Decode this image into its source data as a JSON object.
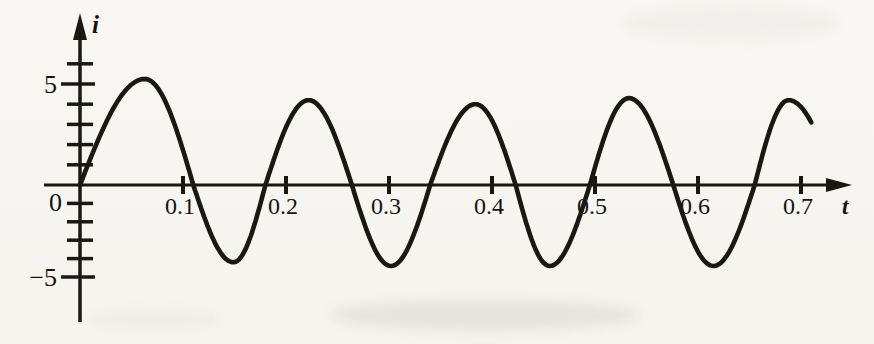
{
  "figure": {
    "kind": "scanned-textbook-graph",
    "paper_color": "#f7f6f2",
    "ink_color": "#1b1713"
  },
  "chart_data": {
    "type": "line",
    "title": "",
    "xlabel": "t",
    "ylabel": "i",
    "xlim": [
      0,
      0.73
    ],
    "ylim": [
      -6,
      7
    ],
    "grid": false,
    "legend": null,
    "origin_label": "0",
    "x_axis": {
      "ticks": [
        0.1,
        0.2,
        0.3,
        0.4,
        0.5,
        0.6,
        0.7
      ],
      "tick_labels": [
        "0.1",
        "0.2",
        "0.3",
        "0.4",
        "0.5",
        "0.6",
        "0.7"
      ]
    },
    "y_axis": {
      "tick_values": [
        -5,
        -4,
        -3,
        -2,
        -1,
        1,
        2,
        3,
        4,
        5,
        6
      ],
      "labels": [
        {
          "value": 5,
          "text": "5"
        },
        {
          "value": 0,
          "text": "0"
        },
        {
          "value": -5,
          "text": "−5"
        }
      ]
    },
    "waveform": {
      "description": "Sinusoidal current i(t) starting upward from the origin; period about 0.15, peaks about +4.2 to +5.3, troughs about -4.2 to -4.4, curve ends mid-descent near (0.71, 3.1)",
      "period": 0.15,
      "amplitude_approx": 4.5,
      "keypoints": [
        {
          "t": 0.0,
          "i": 0
        },
        {
          "t": 0.063,
          "i": 5.25
        },
        {
          "t": 0.11,
          "i": 0
        },
        {
          "t": 0.149,
          "i": -4.2
        },
        {
          "t": 0.18,
          "i": 0
        },
        {
          "t": 0.222,
          "i": 4.2
        },
        {
          "t": 0.264,
          "i": 0
        },
        {
          "t": 0.302,
          "i": -4.4
        },
        {
          "t": 0.34,
          "i": 0
        },
        {
          "t": 0.384,
          "i": 4.0
        },
        {
          "t": 0.423,
          "i": 0
        },
        {
          "t": 0.456,
          "i": -4.4
        },
        {
          "t": 0.495,
          "i": 0
        },
        {
          "t": 0.533,
          "i": 4.3
        },
        {
          "t": 0.576,
          "i": 0
        },
        {
          "t": 0.615,
          "i": -4.4
        },
        {
          "t": 0.655,
          "i": 0
        },
        {
          "t": 0.688,
          "i": 4.2
        },
        {
          "t": 0.71,
          "i": 3.1
        }
      ]
    }
  }
}
